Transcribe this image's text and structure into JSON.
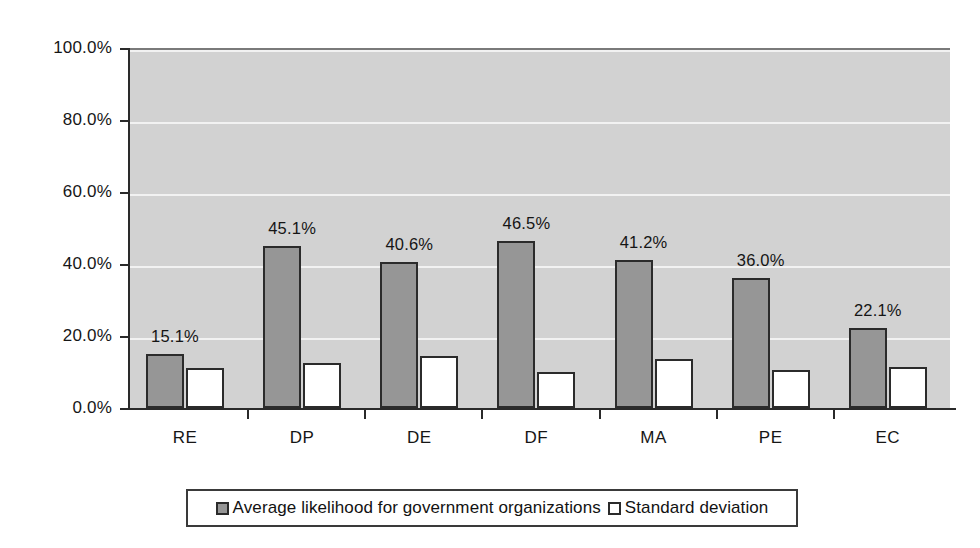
{
  "chart_data": {
    "type": "bar",
    "title": "",
    "subtitle": "",
    "xlabel": "",
    "ylabel": "",
    "ylim": [
      0,
      100
    ],
    "grid": true,
    "legend_position": "bottom",
    "categories": [
      "RE",
      "DP",
      "DE",
      "DF",
      "MA",
      "PE",
      "EC"
    ],
    "y_ticks": [
      "0.0%",
      "20.0%",
      "40.0%",
      "60.0%",
      "80.0%",
      "100.0%"
    ],
    "y_tick_values": [
      0,
      20,
      40,
      60,
      80,
      100
    ],
    "series": [
      {
        "name": "Average likelihood for government organizations",
        "color": "#969696",
        "values": [
          15.1,
          45.1,
          40.6,
          46.5,
          41.2,
          36.0,
          22.1
        ],
        "data_labels": [
          "15.1%",
          "45.1%",
          "40.6%",
          "46.5%",
          "41.2%",
          "36.0%",
          "22.1%"
        ]
      },
      {
        "name": "Standard deviation",
        "color": "#ffffff",
        "values": [
          11.0,
          12.5,
          14.5,
          10.0,
          13.5,
          10.5,
          11.5
        ],
        "data_labels": [
          "",
          "",
          "",
          "",
          "",
          "",
          ""
        ]
      }
    ]
  },
  "legend": {
    "entries": [
      {
        "label": "Average likelihood for government organizations",
        "swatch": "primary"
      },
      {
        "label": "Standard deviation",
        "swatch": "secondary"
      }
    ]
  },
  "colors": {
    "plot_background": "#d2d2d2",
    "gridline": "#f2f2f2",
    "axis": "#2a2a2a",
    "bar_primary": "#969696",
    "bar_secondary": "#ffffff",
    "bar_outline": "#2b2b2b",
    "text": "#161616"
  }
}
